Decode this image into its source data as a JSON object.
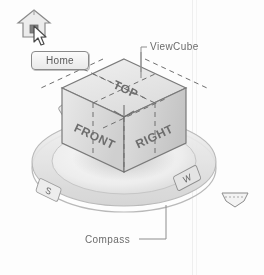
{
  "figure": {
    "background_color": "#fdfdfd",
    "ink_color": "#6b6b6b"
  },
  "home_widget": {
    "icon_name": "home-icon",
    "cursor_name": "arrow-cursor",
    "tooltip_text": "Home"
  },
  "viewcube": {
    "callout_label": "ViewCube",
    "faces": {
      "top": "TOP",
      "front": "FRONT",
      "right": "RIGHT"
    },
    "face_fill": "#e6e6e6",
    "edge_color": "#7a7a7a"
  },
  "compass": {
    "callout_label": "Compass",
    "ring_color": "#cfcfcf",
    "cardinals": [
      {
        "name": "north",
        "label": "N"
      },
      {
        "name": "east",
        "label": "E"
      },
      {
        "name": "south",
        "label": "S"
      },
      {
        "name": "west",
        "label": "W"
      }
    ]
  },
  "menu_button": {
    "name": "viewcube-menu-button",
    "glyph": "▽"
  }
}
